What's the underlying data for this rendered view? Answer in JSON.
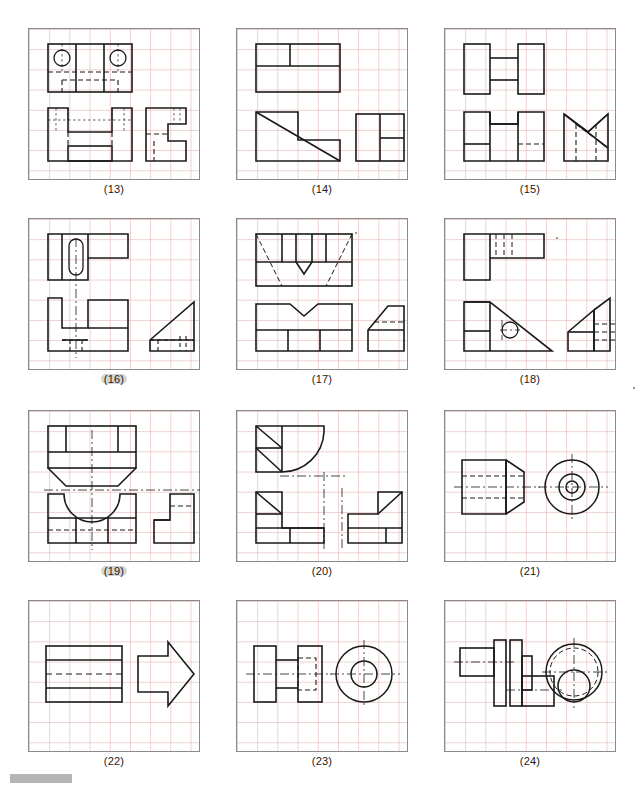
{
  "sheet": {
    "title": "Orthographic projection exercise sheet",
    "grid_color": "#e0aaaa",
    "line_color": "#1a1a1a",
    "frame_color": "#8a8a8a",
    "highlight_color": "#b9b9b9",
    "columns": 3,
    "rows": 4,
    "panel_count": 12
  },
  "panels": [
    {
      "id": "p13",
      "caption": "(13)",
      "highlighted": false,
      "col": 0,
      "row": 0,
      "description": "U-shaped block with two counterbored holes; top view, front view and right side view",
      "views": [
        "top",
        "front",
        "side"
      ],
      "features": [
        "two holes",
        "central slot",
        "step"
      ]
    },
    {
      "id": "p14",
      "caption": "(14)",
      "highlighted": false,
      "col": 1,
      "row": 0,
      "description": "Diagonally cut step block; top view, front view with diagonal, right side view",
      "views": [
        "top",
        "front",
        "side"
      ],
      "features": [
        "diagonal chamfer",
        "step"
      ]
    },
    {
      "id": "p15",
      "caption": "(15)",
      "highlighted": false,
      "col": 2,
      "row": 0,
      "description": "H-shaped dumbbell block; top view, front view and pictorial bowtie side view",
      "views": [
        "top",
        "front",
        "side"
      ],
      "features": [
        "H profile",
        "web",
        "hidden edge"
      ]
    },
    {
      "id": "p16",
      "caption": "(16)",
      "highlighted": true,
      "col": 0,
      "row": 1,
      "description": "L-block with obround slot; top view with slotted hole, front view, triangular side view",
      "views": [
        "top",
        "front",
        "side"
      ],
      "features": [
        "obround slot",
        "centerline",
        "triangular rib"
      ]
    },
    {
      "id": "p17",
      "caption": "(17)",
      "highlighted": false,
      "col": 1,
      "row": 1,
      "description": "V-notched block; top view with hidden V, front view with V notch, side view with chamfer",
      "views": [
        "top",
        "front",
        "side"
      ],
      "features": [
        "V notch",
        "chamfer",
        "hidden lines"
      ]
    },
    {
      "id": "p18",
      "caption": "(18)",
      "highlighted": false,
      "col": 2,
      "row": 1,
      "description": "Triangular gusset bracket with hole; top view, front view with hole, pictorial side view",
      "views": [
        "top",
        "front",
        "side"
      ],
      "features": [
        "hole",
        "triangular gusset",
        "hidden slot"
      ]
    },
    {
      "id": "p19",
      "caption": "(19)",
      "highlighted": true,
      "col": 0,
      "row": 2,
      "description": "Block with semicircular cut; top view with chamfers, front view with U cut, side step view",
      "views": [
        "top",
        "front",
        "side"
      ],
      "features": [
        "semicircular cut",
        "chamfer",
        "centerline"
      ]
    },
    {
      "id": "p20",
      "caption": "(20)",
      "highlighted": false,
      "col": 1,
      "row": 2,
      "description": "L-bracket with quarter-round fillet; top view with radius, front view, side view",
      "views": [
        "top",
        "front",
        "side"
      ],
      "features": [
        "fillet radius",
        "diagonal faces",
        "L profile"
      ]
    },
    {
      "id": "p21",
      "caption": "(21)",
      "highlighted": false,
      "col": 2,
      "row": 2,
      "description": "Tapered cylindrical plug with axial through hole; front view and circular end view",
      "views": [
        "front",
        "end"
      ],
      "features": [
        "taper",
        "through hole",
        "concentric circles"
      ]
    },
    {
      "id": "p22",
      "caption": "(22)",
      "highlighted": false,
      "col": 0,
      "row": 3,
      "description": "Arrow-shaped extrusion; rectangular front view with hidden line and arrow profile view",
      "views": [
        "front",
        "profile"
      ],
      "features": [
        "arrow profile",
        "hidden line"
      ]
    },
    {
      "id": "p23",
      "caption": "(23)",
      "highlighted": false,
      "col": 1,
      "row": 3,
      "description": "Spool / pulley with flanges and bore; front view and circular end view",
      "views": [
        "front",
        "end"
      ],
      "features": [
        "two flanges",
        "bore",
        "hidden square",
        "centerline"
      ]
    },
    {
      "id": "p24",
      "caption": "(24)",
      "highlighted": false,
      "col": 2,
      "row": 3,
      "description": "Offset stepped shaft with collar; front view and circular end view with offset bore",
      "views": [
        "front",
        "end"
      ],
      "features": [
        "offset axis",
        "collar",
        "hidden circles"
      ]
    }
  ],
  "footer": {
    "bar_label": "page-marker-bar"
  }
}
